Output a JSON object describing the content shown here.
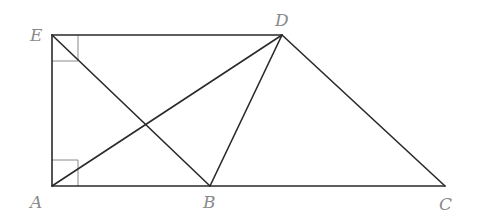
{
  "diagram": {
    "type": "geometry",
    "points": {
      "A": {
        "label": "A",
        "x": 52,
        "y": 186,
        "label_x": 30,
        "label_y": 208
      },
      "B": {
        "label": "B",
        "x": 210,
        "y": 186,
        "label_x": 203,
        "label_y": 208
      },
      "C": {
        "label": "C",
        "x": 445,
        "y": 186,
        "label_x": 439,
        "label_y": 210
      },
      "D": {
        "label": "D",
        "x": 282,
        "y": 35,
        "label_x": 275,
        "label_y": 26
      },
      "E": {
        "label": "E",
        "x": 52,
        "y": 35,
        "label_x": 30,
        "label_y": 40
      }
    },
    "segments": [
      {
        "from": "E",
        "to": "D"
      },
      {
        "from": "E",
        "to": "A"
      },
      {
        "from": "A",
        "to": "C"
      },
      {
        "from": "D",
        "to": "C"
      },
      {
        "from": "E",
        "to": "B"
      },
      {
        "from": "A",
        "to": "D"
      },
      {
        "from": "B",
        "to": "D"
      }
    ],
    "right_angles": [
      {
        "vertex": "E",
        "size": 26
      },
      {
        "vertex": "A",
        "size": 26
      }
    ],
    "colors": {
      "line": "#2a2a2a",
      "label": "#8a8a8a",
      "marker": "#8a8a8a"
    }
  }
}
